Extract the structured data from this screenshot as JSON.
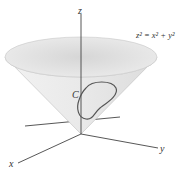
{
  "figure": {
    "equation": "z² = x² + y²",
    "curve_label": "C",
    "axes": {
      "x": "x",
      "y": "y",
      "z": "z"
    },
    "colors": {
      "cone_fill": "#e6e6e6",
      "cone_rim": "#d9d9d9",
      "axis": "#444444",
      "curve": "#555555"
    }
  }
}
